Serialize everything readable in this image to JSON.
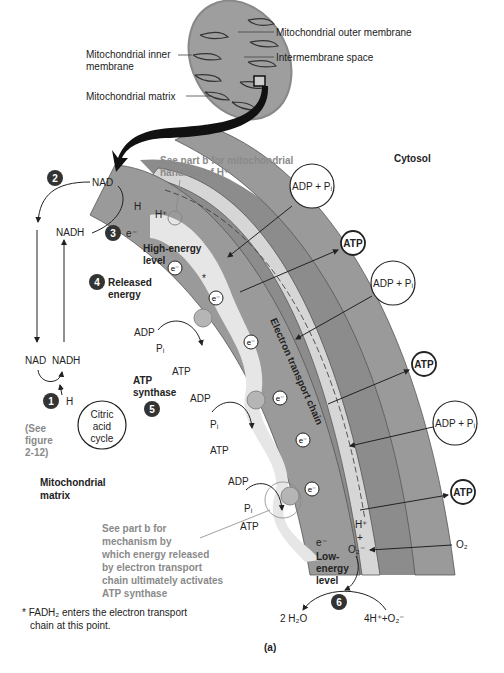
{
  "figure": {
    "panel_label": "(a)",
    "regions": {
      "cytosol": "Cytosol",
      "matrix_line1": "Mitochondrial",
      "matrix_line2": "matrix"
    },
    "mitochondrion_labels": {
      "outer_membrane": "Mitochondrial outer membrane",
      "intermembrane_space": "Intermembrane space",
      "inner_membrane_line1": "Mitochondrial inner",
      "inner_membrane_line2": "membrane",
      "matrix": "Mitochondrial matrix"
    },
    "steps": [
      {
        "number": "1",
        "label": "H"
      },
      {
        "number": "2",
        "label": "NAD"
      },
      {
        "number": "3",
        "label": "e⁻"
      },
      {
        "number": "4",
        "label_line1": "Released",
        "label_line2": "energy"
      },
      {
        "number": "5",
        "label_line1": "ATP",
        "label_line2": "synthase"
      },
      {
        "number": "6",
        "label": ""
      }
    ],
    "nad_cycle": {
      "nad_top": "NAD",
      "nadh_top": "NADH",
      "nad_bottom": "NAD",
      "nadh_bottom": "NADH"
    },
    "citric_acid": {
      "line1": "Citric",
      "line2": "acid",
      "line3": "cycle",
      "see_line1": "(See",
      "see_line2": "figure",
      "see_line3": "2-12)"
    },
    "hydrogen": {
      "h": "H",
      "h_plus": "H⁺",
      "e_minus": "e⁻"
    },
    "energy_levels": {
      "high_line1": "High-energy",
      "high_line2": "level",
      "low_line1": "Low-",
      "low_line2": "energy",
      "low_line3": "level"
    },
    "chain_label": "Electron transport chain",
    "notes": {
      "part_b_h_line1": "See part b for mitochondrial",
      "part_b_h_line2": "handling of H⁺",
      "part_b_mech_line1": "See part b for",
      "part_b_mech_line2": "mechanism by",
      "part_b_mech_line3": "which energy released",
      "part_b_mech_line4": "by electron transport",
      "part_b_mech_line5": "chain ultimately activates",
      "part_b_mech_line6": "ATP synthase",
      "fadh2_line1": "* FADH₂ enters the electron transport",
      "fadh2_line2": "chain at this point."
    },
    "synthase_sites": [
      {
        "adp": "ADP",
        "pi": "Pᵢ",
        "atp": "ATP"
      },
      {
        "adp": "ADP",
        "pi": "Pᵢ",
        "atp": "ATP"
      },
      {
        "adp": "ADP",
        "pi": "Pᵢ",
        "atp": "ATP"
      }
    ],
    "cytosol_exchange": [
      {
        "adp_pi": "ADP + Pᵢ",
        "atp": "ATP"
      },
      {
        "adp_pi": "ADP + Pᵢ",
        "atp": "ATP"
      },
      {
        "adp_pi": "ADP + Pᵢ",
        "atp": "ATP"
      }
    ],
    "oxygen": {
      "o2": "O₂",
      "o2_minus": "O₂⁻",
      "h_plus": "H⁺",
      "plus": "+",
      "e_minus": "e⁻",
      "water": "2 H₂O",
      "reactants": "4H⁺+O₂⁻"
    },
    "electron_carrier": "e⁻",
    "asterisk": "*",
    "colors": {
      "membrane_dark": "#8c8c8c",
      "membrane_light": "#d4d4d4",
      "matrix_band": "#9a9a9a",
      "electron_path": "#e4e4e4",
      "step_badge": "#333333",
      "note_gray": "#8a8a8a"
    }
  }
}
